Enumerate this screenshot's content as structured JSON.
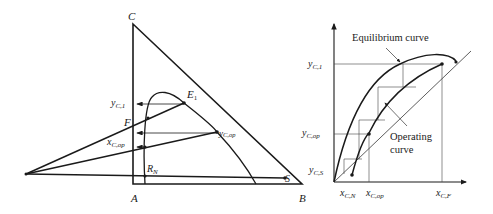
{
  "left_diagram": {
    "title": "Ternary extraction diagram (multistage countercurrent)",
    "vertices": {
      "C": "C",
      "A": "A",
      "B": "B"
    },
    "points": {
      "E1": "E",
      "E1_sub": "1",
      "F": "F",
      "S": "S",
      "RN": "R",
      "RN_sub": "N"
    },
    "labels": {
      "y_c1": {
        "main": "y",
        "sub": "C,1"
      },
      "y_cop": {
        "main": "y",
        "sub": "C,op"
      },
      "x_cop": {
        "main": "x",
        "sub": "C,op"
      }
    }
  },
  "right_diagram": {
    "annotations": {
      "equilibrium": "Equilibrium curve",
      "operating_line1": "Operating",
      "operating_line2": "curve"
    },
    "y_ticks": [
      {
        "main": "y",
        "sub": "C,1"
      },
      {
        "main": "y",
        "sub": "C,op"
      },
      {
        "main": "y",
        "sub": "C,S"
      }
    ],
    "x_ticks": [
      {
        "main": "x",
        "sub": "C,N"
      },
      {
        "main": "x",
        "sub": "C,op"
      },
      {
        "main": "x",
        "sub": "C,F"
      }
    ]
  },
  "colors": {
    "line": "#1a1a1a",
    "thin": "#555555"
  }
}
